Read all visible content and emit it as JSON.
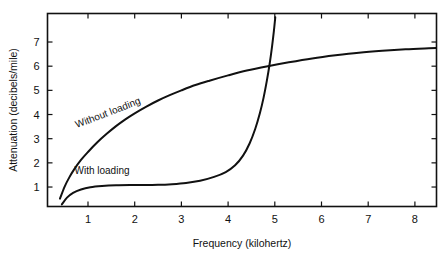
{
  "chart_data": {
    "type": "line",
    "title": "",
    "xlabel": "Frequency (kilohertz)",
    "ylabel": "Attenuation (decibels/mile)",
    "xlim": [
      0.12,
      8.48
    ],
    "ylim": [
      0.0,
      8.02
    ],
    "xticks": [
      1,
      2,
      3,
      4,
      5,
      6,
      7,
      8
    ],
    "yticks": [
      1,
      2,
      3,
      4,
      5,
      6,
      7
    ],
    "xticklabels": [
      "1",
      "2",
      "3",
      "4",
      "5",
      "6",
      "7",
      "8"
    ],
    "yticklabels": [
      "1",
      "2",
      "3",
      "4",
      "5",
      "6",
      "7"
    ],
    "grid": false,
    "legend": "inline-curve-labels",
    "line_color": "#111111",
    "background": "#ffffff",
    "series": [
      {
        "name": "Without loading",
        "label": "Without loading",
        "label_rotation_deg": -21,
        "points": [
          [
            0.4,
            0.52
          ],
          [
            0.5,
            1.02
          ],
          [
            0.6,
            1.4
          ],
          [
            0.7,
            1.72
          ],
          [
            0.85,
            2.12
          ],
          [
            1.0,
            2.45
          ],
          [
            1.2,
            2.85
          ],
          [
            1.4,
            3.2
          ],
          [
            1.6,
            3.52
          ],
          [
            1.8,
            3.8
          ],
          [
            2.0,
            4.05
          ],
          [
            2.25,
            4.33
          ],
          [
            2.5,
            4.58
          ],
          [
            2.75,
            4.8
          ],
          [
            3.0,
            5.0
          ],
          [
            3.3,
            5.22
          ],
          [
            3.6,
            5.4
          ],
          [
            4.0,
            5.62
          ],
          [
            4.4,
            5.82
          ],
          [
            4.85,
            6.0
          ],
          [
            5.3,
            6.16
          ],
          [
            5.8,
            6.32
          ],
          [
            6.3,
            6.45
          ],
          [
            6.8,
            6.56
          ],
          [
            7.3,
            6.64
          ],
          [
            7.8,
            6.7
          ],
          [
            8.3,
            6.74
          ],
          [
            8.48,
            6.75
          ]
        ]
      },
      {
        "name": "With loading",
        "label": "With loading",
        "label_rotation_deg": 0,
        "points": [
          [
            0.44,
            0.28
          ],
          [
            0.55,
            0.56
          ],
          [
            0.68,
            0.76
          ],
          [
            0.85,
            0.9
          ],
          [
            1.05,
            0.99
          ],
          [
            1.3,
            1.04
          ],
          [
            1.6,
            1.07
          ],
          [
            1.9,
            1.08
          ],
          [
            2.2,
            1.08
          ],
          [
            2.5,
            1.09
          ],
          [
            2.8,
            1.12
          ],
          [
            3.1,
            1.17
          ],
          [
            3.4,
            1.26
          ],
          [
            3.7,
            1.42
          ],
          [
            3.95,
            1.62
          ],
          [
            4.15,
            1.9
          ],
          [
            4.32,
            2.3
          ],
          [
            4.46,
            2.8
          ],
          [
            4.58,
            3.4
          ],
          [
            4.68,
            4.05
          ],
          [
            4.76,
            4.7
          ],
          [
            4.83,
            5.4
          ],
          [
            4.89,
            6.1
          ],
          [
            4.94,
            6.8
          ],
          [
            4.98,
            7.45
          ],
          [
            5.01,
            8.02
          ]
        ]
      }
    ],
    "annotations": [
      {
        "text": "Without loading",
        "x": 1.45,
        "y": 3.95,
        "rotation": -21
      },
      {
        "text": "With loading",
        "x": 1.3,
        "y": 1.55,
        "rotation": 0
      }
    ]
  },
  "axes": {
    "x_title": "Frequency (kilohertz)",
    "y_title": "Attenuation (decibels/mile)"
  }
}
